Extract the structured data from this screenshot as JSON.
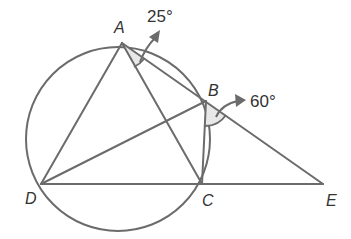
{
  "diagram": {
    "type": "circle-geometry",
    "points": {
      "A": {
        "label": "A",
        "x": 122,
        "y": 43
      },
      "B": {
        "label": "B",
        "x": 206,
        "y": 101
      },
      "C": {
        "label": "C",
        "x": 202,
        "y": 184
      },
      "D": {
        "label": "D",
        "x": 41,
        "y": 184
      },
      "E": {
        "label": "E",
        "x": 323,
        "y": 184
      }
    },
    "circle": {
      "cx": 118,
      "cy": 139,
      "r": 92
    },
    "segments": [
      [
        "A",
        "D"
      ],
      [
        "A",
        "C"
      ],
      [
        "A",
        "E"
      ],
      [
        "D",
        "B"
      ],
      [
        "D",
        "E"
      ],
      [
        "B",
        "C"
      ]
    ],
    "angles": [
      {
        "vertex": "A",
        "between": [
          "C",
          "B"
        ],
        "label": "25°"
      },
      {
        "vertex": "B",
        "between": [
          "C",
          "E"
        ],
        "label": "60°"
      }
    ],
    "colors": {
      "stroke": "#6b6b6b",
      "text": "#333333",
      "arc_fill": "#e6e6e6"
    }
  }
}
